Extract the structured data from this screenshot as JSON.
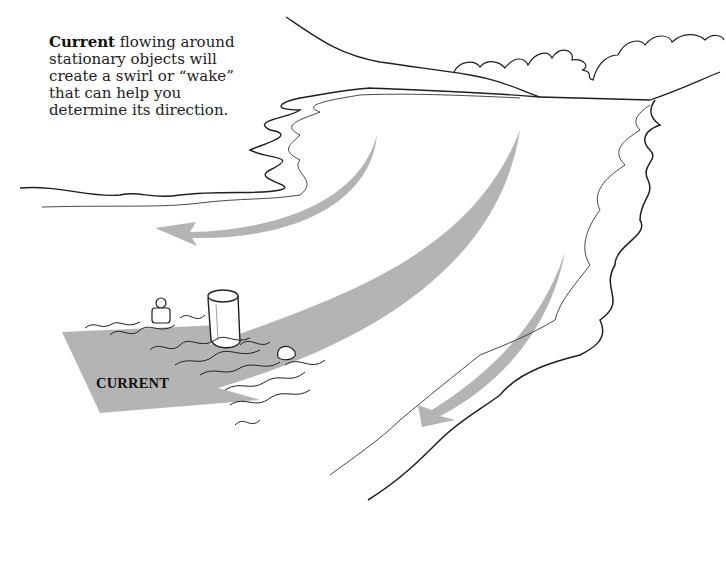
{
  "caption": {
    "bold_word": "Current",
    "text": " flowing around stationary objects will create a swirl or “wake” that can help you determine its direction."
  },
  "arrow_label": "CURRENT",
  "colors": {
    "arrow_fill": "#b4b4b4",
    "line": "#1e1e1e",
    "background": "#ffffff"
  },
  "elements": {
    "main_arrow": "large curved current arrow pointing left toward viewer",
    "upper_arrow": "curved arrow along left shore",
    "right_arrow": "curved arrow along right shore",
    "piling": "cylindrical piling with wake",
    "buoy_left": "small buoy with wake",
    "buoy_right": "float/buoy with wake",
    "shorelines": "wavy left and right banks",
    "horizon": "distant hills and clouds"
  }
}
